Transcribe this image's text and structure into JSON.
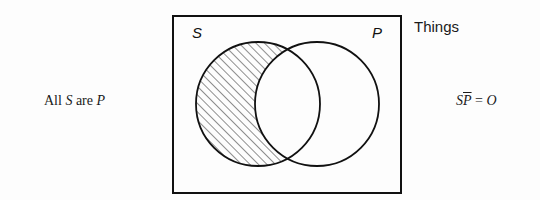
{
  "diagram": {
    "type": "venn",
    "universe": {
      "label": "Things",
      "box": {
        "x": 173,
        "y": 16,
        "width": 228,
        "height": 177
      }
    },
    "sets": [
      {
        "id": "S",
        "label": "S",
        "cx": 258,
        "cy": 104,
        "r": 62
      },
      {
        "id": "P",
        "label": "P",
        "cx": 317,
        "cy": 104,
        "r": 62
      }
    ],
    "shaded_region": "S not P",
    "statement": {
      "prefix": "All ",
      "subject": "S",
      "middle": " are ",
      "predicate": "P"
    },
    "formula": {
      "subject": "S",
      "negated_predicate": "P",
      "equals": " = ",
      "result": "O"
    },
    "colors": {
      "stroke": "#111111",
      "hatch": "#222222",
      "background": "#fdfdfd"
    }
  }
}
